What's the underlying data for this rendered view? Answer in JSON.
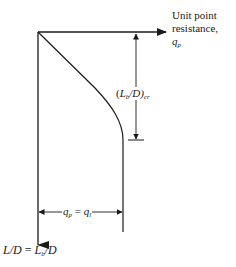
{
  "diagram": {
    "x_axis": {
      "label_line1": "Unit point",
      "label_line2": "resistance,",
      "label_symbol": "q",
      "label_symbol_sub": "p"
    },
    "y_axis": {
      "label_left": "L/D",
      "label_equals": "=",
      "label_right_main": "L",
      "label_right_sub": "b",
      "label_right_tail": "/D"
    },
    "critical_depth": {
      "open": "(",
      "main": "L",
      "sub": "b",
      "tail": "/D)",
      "subscript": "cr"
    },
    "limit_value": {
      "left": "q",
      "left_sub": "p",
      "equals": "=",
      "right": "q",
      "right_sub": "l"
    },
    "colors": {
      "line": "#1a1a1a",
      "background": "#ffffff"
    }
  }
}
